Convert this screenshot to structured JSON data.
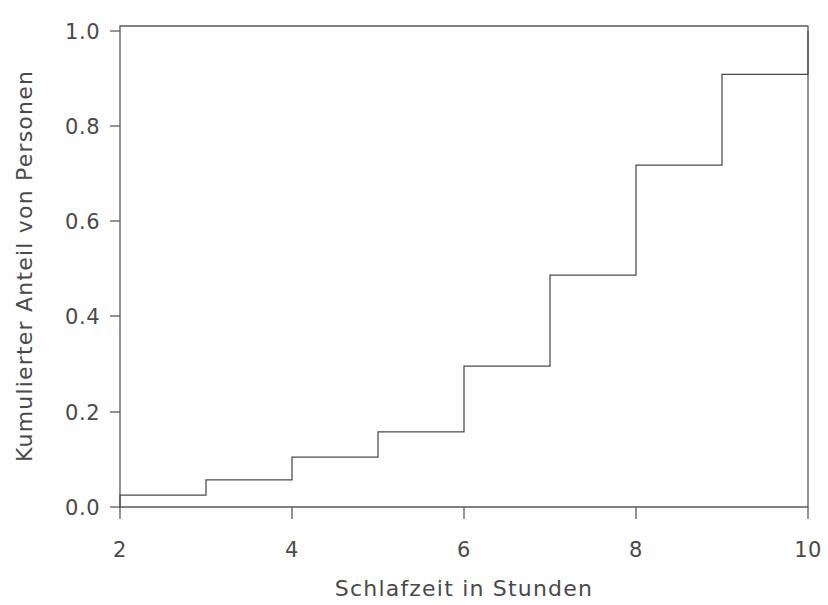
{
  "chart_data": {
    "type": "line",
    "subtype": "step-ecdf",
    "title": "",
    "xlabel": "Schlafzeit in Stunden",
    "ylabel": "Kumulierter Anteil von Personen",
    "xlim": [
      2,
      10
    ],
    "ylim": [
      0.0,
      1.0
    ],
    "grid": false,
    "legend": null,
    "xticks": [
      2,
      4,
      6,
      8,
      10
    ],
    "xticklabels": [
      "2",
      "4",
      "6",
      "8",
      "10"
    ],
    "yticks": [
      0.0,
      0.2,
      0.4,
      0.6,
      0.8,
      1.0
    ],
    "yticklabels": [
      "0.0",
      "0.2",
      "0.4",
      "0.6",
      "0.8",
      "1.0"
    ],
    "x": [
      2,
      3,
      4,
      5,
      6,
      7,
      8,
      9,
      10
    ],
    "values": [
      0.025,
      0.057,
      0.105,
      0.158,
      0.296,
      0.487,
      0.718,
      0.909,
      1.0
    ],
    "steps": [
      {
        "x": 2,
        "y": 0.025
      },
      {
        "x": 3,
        "y": 0.057
      },
      {
        "x": 4,
        "y": 0.105
      },
      {
        "x": 5,
        "y": 0.158
      },
      {
        "x": 6,
        "y": 0.296
      },
      {
        "x": 7,
        "y": 0.487
      },
      {
        "x": 8,
        "y": 0.718
      },
      {
        "x": 9,
        "y": 0.909
      },
      {
        "x": 10,
        "y": 1.0
      }
    ],
    "line_color": "#4a4a4a",
    "axis_color": "#5a5a5a",
    "background_color": "#fefefe"
  }
}
